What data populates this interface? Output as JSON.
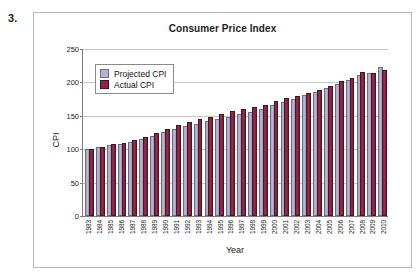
{
  "problem_number": "3.",
  "chart_data": {
    "type": "bar",
    "title": "Consumer Price Index",
    "xlabel": "Year",
    "ylabel": "CPI",
    "ylim": [
      0,
      250
    ],
    "yticks": [
      0,
      50,
      100,
      150,
      200,
      250
    ],
    "grid": true,
    "legend_position": "top-left",
    "categories": [
      "1983",
      "1984",
      "1985",
      "1986",
      "1987",
      "1988",
      "1989",
      "1990",
      "1991",
      "1992",
      "1993",
      "1994",
      "1995",
      "1996",
      "1997",
      "1998",
      "1999",
      "2000",
      "2001",
      "2002",
      "2003",
      "2004",
      "2005",
      "2006",
      "2007",
      "2008",
      "2009",
      "2010"
    ],
    "series": [
      {
        "name": "Projected CPI",
        "color": "#b6b2cd",
        "values": [
          100.0,
          103.5,
          106.5,
          108.5,
          111.5,
          115.5,
          120.0,
          126.0,
          131.0,
          134.5,
          138.0,
          141.5,
          145.0,
          148.5,
          152.0,
          155.5,
          160.0,
          165.5,
          170.5,
          175.5,
          180.5,
          185.5,
          191.5,
          197.0,
          203.0,
          210.5,
          214.5,
          223.0
        ]
      },
      {
        "name": "Actual CPI",
        "color": "#8a2740",
        "values": [
          99.6,
          103.9,
          107.6,
          109.6,
          113.6,
          118.3,
          124.0,
          130.7,
          136.2,
          140.3,
          144.5,
          148.2,
          152.4,
          156.9,
          160.5,
          163.0,
          166.6,
          172.2,
          177.1,
          179.9,
          184.0,
          188.9,
          195.3,
          201.6,
          207.3,
          215.3,
          214.5,
          218.1
        ]
      }
    ]
  },
  "legend": {
    "items": [
      {
        "label": "Projected CPI"
      },
      {
        "label": "Actual CPI"
      }
    ]
  }
}
